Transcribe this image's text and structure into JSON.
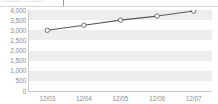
{
  "header": {
    "fragment_text": "□□□□□ □□□□□",
    "rule_color": "#d7d7d7"
  },
  "chart_data": {
    "type": "line",
    "title": "",
    "subtitle": "",
    "xlabel": "",
    "ylabel": "",
    "categories": [
      "12/03",
      "12/04",
      "12/05",
      "12/06",
      "12/07"
    ],
    "series": [
      {
        "name": "",
        "values": [
          3000,
          3250,
          3500,
          3700,
          3950
        ]
      }
    ],
    "ytick_labels": [
      "4,000",
      "3,500",
      "3,000",
      "2,500",
      "2,000",
      "1,500",
      "1,000",
      "500",
      "0"
    ],
    "ytick_values": [
      4000,
      3500,
      3000,
      2500,
      2000,
      1500,
      1000,
      500,
      0
    ],
    "ylim": [
      0,
      4000
    ],
    "ytick_step": 500,
    "grid": "horizontal-bands",
    "legend": "none",
    "marker": "open-circle",
    "colors": {
      "line": "#595959",
      "marker_fill": "#ffffff",
      "marker_stroke": "#6e6e6e",
      "band": "#ededed",
      "plot_background": "#ffffff",
      "axis": "#c9c9c9",
      "tick_text": "#8d8d8d"
    }
  }
}
